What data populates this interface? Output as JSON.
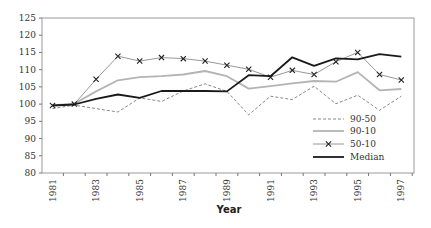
{
  "chart_data": {
    "type": "line",
    "title": "",
    "xlabel": "Year",
    "ylabel": "",
    "ylim": [
      80,
      125
    ],
    "yticks": [
      80,
      85,
      90,
      95,
      100,
      105,
      110,
      115,
      120,
      125
    ],
    "x": [
      1981,
      1982,
      1983,
      1984,
      1985,
      1986,
      1987,
      1988,
      1989,
      1990,
      1991,
      1992,
      1993,
      1994,
      1995,
      1996,
      1997
    ],
    "xtick_labels": [
      "1981",
      "1983",
      "1985",
      "1987",
      "1989",
      "1991",
      "1993",
      "1995",
      "1997"
    ],
    "grid": false,
    "legend_position": "lower right (inside plot)",
    "series": [
      {
        "name": "90-50",
        "style": "dashed",
        "color": "#888888",
        "values": [
          98.7,
          99.7,
          98.7,
          97.7,
          101.8,
          100.8,
          103.8,
          105.9,
          103.7,
          96.9,
          102.3,
          101.3,
          105.2,
          100.1,
          102.6,
          98.2,
          102.3
        ]
      },
      {
        "name": "90-10",
        "style": "solid-light",
        "color": "#b4b4b4",
        "values": [
          99.7,
          100.1,
          103.7,
          106.9,
          107.8,
          108.1,
          108.6,
          109.6,
          108.1,
          104.5,
          105.2,
          106.0,
          106.7,
          106.5,
          109.3,
          104.0,
          104.4
        ]
      },
      {
        "name": "50-10",
        "style": "solid-thin-x-markers",
        "color": "#8c8c8c",
        "values": [
          99.6,
          100.0,
          107.2,
          113.9,
          112.5,
          113.5,
          113.2,
          112.5,
          111.3,
          110.1,
          107.8,
          109.8,
          108.6,
          112.3,
          115.0,
          108.6,
          107.0
        ]
      },
      {
        "name": "Median",
        "style": "solid-bold",
        "color": "#1a1a1a",
        "values": [
          99.6,
          99.9,
          101.5,
          102.8,
          101.8,
          103.8,
          103.8,
          103.8,
          103.7,
          108.4,
          108.1,
          113.6,
          111.1,
          113.3,
          113.0,
          114.5,
          113.8
        ]
      }
    ]
  }
}
